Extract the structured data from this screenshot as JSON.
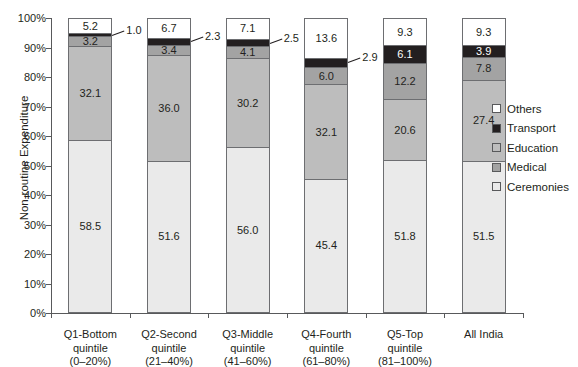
{
  "chart_data": {
    "type": "bar",
    "subtype": "stacked-percentage",
    "title": "",
    "xlabel": "",
    "ylabel": "Non-routine Expenditure",
    "ylim": [
      0,
      100
    ],
    "ytick_labels": [
      "100%",
      "90%",
      "80%",
      "70%",
      "60%",
      "50%",
      "40%",
      "30%",
      "20%",
      "10%",
      "0%"
    ],
    "ytick_values": [
      100,
      90,
      80,
      70,
      60,
      50,
      40,
      30,
      20,
      10,
      0
    ],
    "grid": false,
    "legend_position": "right",
    "categories": [
      "Q1-Bottom quintile (0–20%)",
      "Q2-Second quintile (21–40%)",
      "Q3-Middle quintile (41–60%)",
      "Q4-Fourth quintile (61–80%)",
      "Q5-Top quintile (81–100%)",
      "All India"
    ],
    "category_lines": [
      [
        "Q1-Bottom",
        "quintile",
        "(0–20%)"
      ],
      [
        "Q2-Second",
        "quintile",
        "(21–40%)"
      ],
      [
        "Q3-Middle",
        "quintile",
        "(41–60%)"
      ],
      [
        "Q4-Fourth",
        "quintile",
        "(61–80%)"
      ],
      [
        "Q5-Top",
        "quintile",
        "(81–100%)"
      ],
      [
        "All India"
      ]
    ],
    "series": [
      {
        "name": "Ceremonies",
        "color": "#eaeaea",
        "values": [
          58.5,
          51.6,
          56.0,
          45.4,
          51.8,
          51.5
        ]
      },
      {
        "name": "Education",
        "color": "#bdbdbd",
        "values": [
          32.1,
          36.0,
          30.2,
          32.1,
          20.6,
          27.4
        ]
      },
      {
        "name": "Medical",
        "color": "#a3a3a3",
        "values": [
          3.2,
          3.4,
          4.1,
          6.0,
          12.2,
          7.8
        ]
      },
      {
        "name": "Transport",
        "color": "#231f20",
        "values": [
          1.0,
          2.3,
          2.5,
          2.9,
          6.1,
          3.9
        ]
      },
      {
        "name": "Others",
        "color": "#ffffff",
        "values": [
          5.2,
          6.7,
          7.1,
          13.6,
          9.3,
          9.3
        ]
      }
    ],
    "legend": [
      {
        "label": "Others",
        "color": "#ffffff"
      },
      {
        "label": "Transport",
        "color": "#231f20"
      },
      {
        "label": "Education",
        "color": "#bdbdbd"
      },
      {
        "label": "Medical",
        "color": "#a3a3a3"
      },
      {
        "label": "Ceremonies",
        "color": "#eaeaea"
      }
    ],
    "callouts": [
      {
        "series": "Transport",
        "category_index": 0,
        "value": "1.0"
      },
      {
        "series": "Transport",
        "category_index": 1,
        "value": "2.3"
      },
      {
        "series": "Transport",
        "category_index": 2,
        "value": "2.5"
      },
      {
        "series": "Transport",
        "category_index": 3,
        "value": "2.9"
      }
    ]
  }
}
